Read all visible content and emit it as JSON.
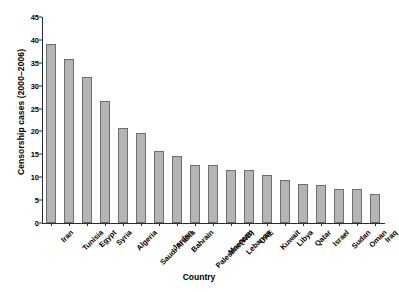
{
  "chart_data": {
    "type": "bar",
    "title": "",
    "xlabel": "Country",
    "ylabel": "Censorship cases (2000–2006)",
    "categories": [
      "Iran",
      "Tunisia",
      "Egypt",
      "Syria",
      "Algeria",
      "Saudi Arabia",
      "Jordan",
      "Bahrain",
      "Palestine(WB)",
      "Morocco",
      "Lebanon",
      "UAE",
      "Kuwait",
      "Libya",
      "Qatar",
      "Israel",
      "Sudan",
      "Oman",
      "Iraq"
    ],
    "values": [
      39,
      35.8,
      31.8,
      26.6,
      20.7,
      19.6,
      15.7,
      14.6,
      12.7,
      12.6,
      11.6,
      11.5,
      10.5,
      9.5,
      8.5,
      8.4,
      7.5,
      7.4,
      6.3
    ],
    "ylim": [
      0,
      45
    ],
    "yticks": [
      0,
      5,
      10,
      15,
      20,
      25,
      30,
      35,
      40,
      45
    ],
    "ytick_labels": [
      "0",
      "5",
      "10",
      "15",
      "20",
      "25",
      "30",
      "35",
      "40",
      "45"
    ],
    "grid": false,
    "legend": null,
    "bar_color": "#b4b4b4",
    "bar_edge_color": "#6e6e6e",
    "axis_color": "#2b2b2b",
    "background_color": "#ffffff"
  }
}
